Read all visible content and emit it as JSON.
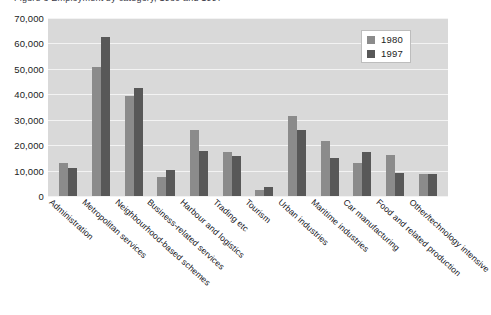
{
  "title_sliver": "Figure 3  Employment by category, 1980 and 1997",
  "legend": {
    "position": "top-right",
    "entries": [
      {
        "label": "1980",
        "color": "#8b8b8b"
      },
      {
        "label": "1997",
        "color": "#585858"
      }
    ]
  },
  "axis": {
    "yticks": [
      "0",
      "10,000",
      "20,000",
      "30,000",
      "40,000",
      "50,000",
      "60,000",
      "70,000"
    ]
  },
  "chart_data": {
    "type": "bar",
    "title": "",
    "xlabel": "",
    "ylabel": "",
    "ylim": [
      0,
      70000
    ],
    "ytick_values": [
      0,
      10000,
      20000,
      30000,
      40000,
      50000,
      60000,
      70000
    ],
    "grid": true,
    "legend_position": "top-right",
    "categories": [
      "Administration",
      "Metropolitan services",
      "Neighbourhood-based schemes",
      "Business-related services",
      "Harbour and logistics",
      "Trading etc",
      "Tourism",
      "Urban industries",
      "Maritime industries",
      "Car manufacturing",
      "Food and related production",
      "Other/technology intensive"
    ],
    "series": [
      {
        "name": "1980",
        "color": "#8b8b8b",
        "values": [
          12800,
          50700,
          39500,
          7400,
          26000,
          17200,
          2500,
          31300,
          21700,
          13000,
          16200,
          8800
        ]
      },
      {
        "name": "1997",
        "color": "#585858",
        "values": [
          11000,
          62700,
          42500,
          10300,
          17600,
          15600,
          3500,
          25800,
          14900,
          17300,
          9200,
          8500
        ]
      }
    ]
  }
}
